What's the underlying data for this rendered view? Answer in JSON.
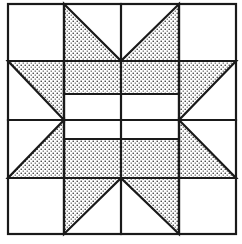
{
  "diagram": {
    "type": "quilt-block",
    "colors": {
      "background": "#ffffff",
      "line": "#1a1a1a",
      "dot": "#1a1a1a"
    },
    "grid": {
      "columns": [
        8,
        64,
        121,
        179,
        236
      ],
      "rows": [
        4,
        61,
        120,
        178,
        234
      ]
    },
    "center_bars": {
      "upper": {
        "y1": 61,
        "y2": 94
      },
      "lower": {
        "y1": 139,
        "y2": 178
      },
      "divider_upper": 94,
      "divider_lower": 139
    },
    "shaded_pieces": [
      {
        "name": "top-left-star-point",
        "points": "64,4 121,61 64,61"
      },
      {
        "name": "top-right-star-point",
        "points": "179,4 179,61 121,61"
      },
      {
        "name": "left-upper-star-point",
        "points": "8,61 64,61 64,120"
      },
      {
        "name": "right-upper-star-point",
        "points": "179,61 236,61 179,120"
      },
      {
        "name": "upper-center-bar",
        "points": "64,61 179,61 179,94 64,94"
      },
      {
        "name": "lower-center-bar",
        "points": "64,139 179,139 179,178 64,178"
      },
      {
        "name": "left-lower-star-point",
        "points": "64,120 64,178 8,178"
      },
      {
        "name": "right-lower-star-point",
        "points": "179,120 236,178 179,178"
      },
      {
        "name": "bottom-left-star-point",
        "points": "64,178 121,178 64,234"
      },
      {
        "name": "bottom-right-star-point",
        "points": "121,178 179,178 179,234"
      }
    ]
  }
}
